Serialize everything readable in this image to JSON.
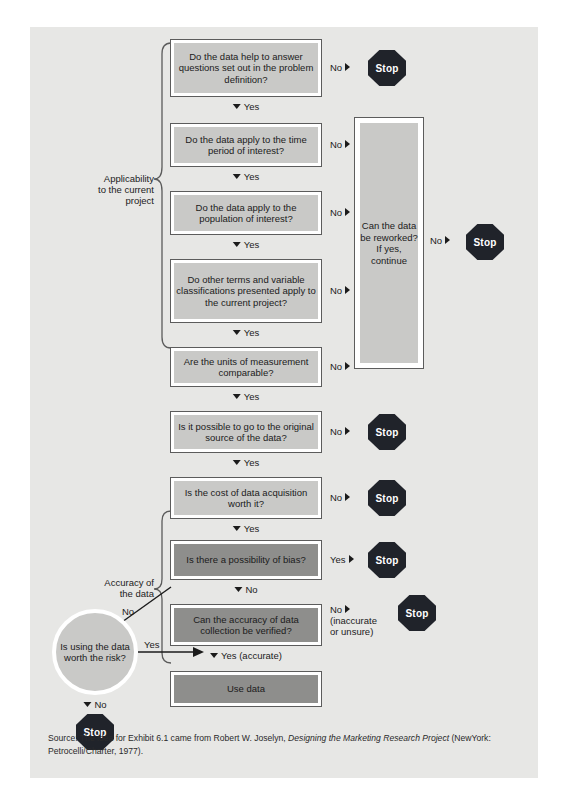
{
  "exhibit": {
    "background_color": "#e7e7e5",
    "box_light_fill": "#c9c9c7",
    "box_dark_fill": "#8e8e8c",
    "stop_color": "#20232a"
  },
  "group_labels": {
    "applicability": "Applicability\nto the current\nproject",
    "applicability_lines": [
      "Applicability",
      "to the current",
      "project"
    ],
    "accuracy": "Accuracy of\nthe data",
    "accuracy_lines": [
      "Accuracy of",
      "the data"
    ]
  },
  "nodes": [
    {
      "id": "q1",
      "text": "Do the data help to answer questions set out in the problem definition?",
      "style": "light"
    },
    {
      "id": "q2",
      "text": "Do the data apply to the time period of interest?",
      "style": "light"
    },
    {
      "id": "q3",
      "text": "Do the data apply to the population of interest?",
      "style": "light"
    },
    {
      "id": "q4",
      "text": "Do other terms and variable classifications presented apply to the current project?",
      "style": "light"
    },
    {
      "id": "q5",
      "text": "Are the units of measurement comparable?",
      "style": "light"
    },
    {
      "id": "q6",
      "text": "Is it possible to go to the original source of the data?",
      "style": "light"
    },
    {
      "id": "q7",
      "text": "Is the cost of data acquisition worth it?",
      "style": "light"
    },
    {
      "id": "q8",
      "text": "Is there a possibility of bias?",
      "style": "dark"
    },
    {
      "id": "q9",
      "text": "Can the accuracy of data collection be verified?",
      "style": "dark"
    },
    {
      "id": "q10",
      "text": "Use data",
      "style": "dark"
    },
    {
      "id": "rework",
      "text": "Can the data be reworked? If yes, continue",
      "style": "light"
    },
    {
      "id": "circle",
      "text": "Is using the data worth the risk?",
      "style": "circle"
    }
  ],
  "edge_labels": {
    "no": "No",
    "yes": "Yes",
    "no_down": "No",
    "yes_down": "Yes",
    "yes_accurate": "Yes (accurate)",
    "no_inaccurate_l1": "No",
    "no_inaccurate_l2": "(inaccurate",
    "no_inaccurate_l3": "or unsure)",
    "no_diagonal": "Yes",
    "no_to_circle": "No"
  },
  "stops": {
    "label": "Stop",
    "count": 6
  },
  "source": {
    "prefix": "Source: The idea for Exhibit 6.1 came from Robert W. Joselyn, ",
    "italic": "Designing the Marketing Research Project",
    "suffix": " (NewYork: Petrocelli/Charter, 1977)."
  }
}
